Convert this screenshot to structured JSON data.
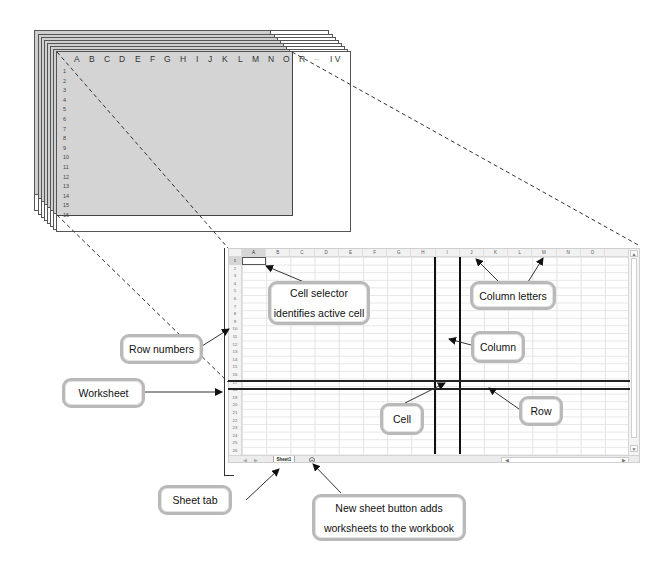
{
  "stack": {
    "column_letters": [
      "A",
      "B",
      "C",
      "D",
      "E",
      "F",
      "G",
      "H",
      "I",
      "J",
      "K",
      "L",
      "M",
      "N",
      "O",
      "R",
      "...",
      "I V"
    ],
    "row_numbers": [
      "1",
      "2",
      "3",
      "4",
      "5",
      "6",
      "7",
      "8",
      "9",
      "10",
      "11",
      "12",
      "13",
      "14",
      "15",
      "16"
    ]
  },
  "spreadsheet": {
    "columns": [
      "A",
      "B",
      "C",
      "D",
      "E",
      "F",
      "G",
      "H",
      "I",
      "J",
      "K",
      "L",
      "M",
      "N",
      "O"
    ],
    "rows": [
      "1",
      "2",
      "3",
      "4",
      "5",
      "6",
      "7",
      "8",
      "9",
      "10",
      "11",
      "12",
      "13",
      "14",
      "15",
      "16",
      "17",
      "18",
      "19",
      "20",
      "21",
      "22",
      "23",
      "24",
      "25",
      "26"
    ],
    "active_cell": "A1",
    "highlighted_column": "I",
    "highlighted_row": "17",
    "sheet_tab_label": "Sheet1",
    "new_sheet_icon": "+",
    "tab_nav_prev": "◀",
    "tab_nav_next": "▶",
    "scroll_up": "▲",
    "scroll_down": "▼",
    "scroll_left": "◀",
    "scroll_right": "▶"
  },
  "callouts": {
    "cell_selector_line1": "Cell selector",
    "cell_selector_line2": "identifies active cell",
    "column_letters": "Column letters",
    "row_numbers": "Row numbers",
    "column": "Column",
    "worksheet": "Worksheet",
    "cell": "Cell",
    "row": "Row",
    "sheet_tab": "Sheet tab",
    "new_sheet_line1": "New sheet button adds",
    "new_sheet_line2": "worksheets to the workbook"
  },
  "colors": {
    "stack_gray": "#d4d4d4",
    "callout_border": "#b9b9b9",
    "highlight_line": "#111111"
  }
}
